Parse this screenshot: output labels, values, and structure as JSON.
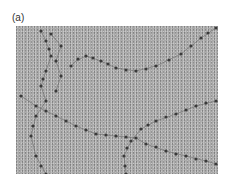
{
  "figure": {
    "panel_label": "(a)",
    "image_description": "Electron micrograph of chromatin fibers showing nucleosomes as beads on a string",
    "background_color": "#a9a9a9",
    "bead_color": "#3a3a3a"
  }
}
